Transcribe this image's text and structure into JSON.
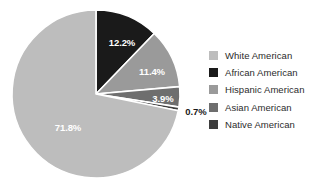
{
  "chart_data": {
    "type": "pie",
    "title": "",
    "subtitle": "",
    "xlabel": "",
    "ylabel": "",
    "grid": false,
    "legend_position": "right",
    "start_angle_deg": 0,
    "direction": "clockwise",
    "categories": [
      "White American",
      "African American",
      "Hispanic American",
      "Asian American",
      "Native American"
    ],
    "values": [
      71.8,
      12.2,
      11.4,
      3.9,
      0.7
    ],
    "value_labels": [
      "71.8%",
      "12.2%",
      "11.4%",
      "3.9%",
      "0.7%"
    ],
    "colors": [
      "#bdbdbd",
      "#1a1a1a",
      "#9a9a9a",
      "#6e6e6e",
      "#3d3d3d"
    ],
    "slices": [
      {
        "name": "African American",
        "value": 12.2,
        "label": "12.2%",
        "color": "#1a1a1a",
        "label_color": "#ffffff",
        "label_placement": "inside",
        "label_x": 122,
        "label_y": 42,
        "start_deg": 0,
        "end_deg": 43.92
      },
      {
        "name": "Hispanic American",
        "value": 11.4,
        "label": "11.4%",
        "color": "#9a9a9a",
        "label_color": "#ffffff",
        "label_placement": "inside",
        "label_x": 152,
        "label_y": 71,
        "start_deg": 43.92,
        "end_deg": 84.96
      },
      {
        "name": "Asian American",
        "value": 3.9,
        "label": "3.9%",
        "color": "#6e6e6e",
        "label_color": "#ffffff",
        "label_placement": "inside",
        "label_x": 163,
        "label_y": 98,
        "start_deg": 84.96,
        "end_deg": 99.0
      },
      {
        "name": "Native American",
        "value": 0.7,
        "label": "0.7%",
        "color": "#3d3d3d",
        "label_color": "#1a1a1a",
        "label_placement": "outside",
        "label_x": 196,
        "label_y": 111,
        "start_deg": 99.0,
        "end_deg": 101.52
      },
      {
        "name": "White American",
        "value": 71.8,
        "label": "71.8%",
        "color": "#bdbdbd",
        "label_color": "#ffffff",
        "label_placement": "inside",
        "label_x": 68,
        "label_y": 127,
        "start_deg": 101.52,
        "end_deg": 360
      }
    ],
    "geometry": {
      "center_x": 96,
      "center_y": 94,
      "radius": 84,
      "separator_color": "#ffffff",
      "separator_width": 1.6
    }
  },
  "legend": {
    "position": "right",
    "items": [
      {
        "label": "White American",
        "color": "#bdbdbd"
      },
      {
        "label": "African American",
        "color": "#1a1a1a"
      },
      {
        "label": "Hispanic American",
        "color": "#9a9a9a"
      },
      {
        "label": "Asian American",
        "color": "#6e6e6e"
      },
      {
        "label": "Native American",
        "color": "#3d3d3d"
      }
    ]
  },
  "canvas": {
    "background": "#ffffff",
    "width": 332,
    "height": 189
  }
}
